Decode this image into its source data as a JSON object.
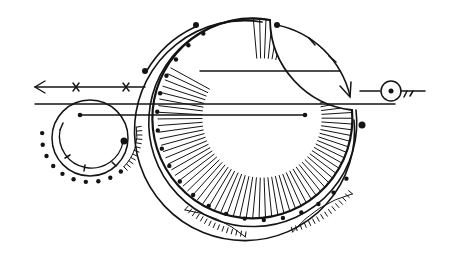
{
  "illustration": {
    "title": "Crescent moon celestial line-art",
    "background": "#ffffff",
    "ink": "#141414",
    "elements": [
      "crescent-moon",
      "hatched-inner-band",
      "dotted-ring",
      "orbit-arc-with-arrow",
      "left-arrow-with-crosses",
      "small-orbit-circle",
      "sun-symbol",
      "tick-arcs"
    ]
  }
}
